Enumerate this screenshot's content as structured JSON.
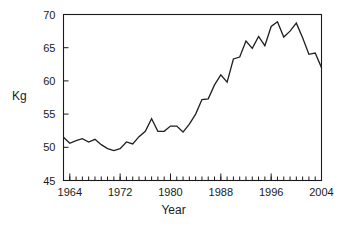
{
  "chart_data": {
    "type": "line",
    "title": "",
    "xlabel": "Year",
    "ylabel": "Kg",
    "xlim": [
      1963,
      2004
    ],
    "ylim": [
      45,
      70
    ],
    "grid": false,
    "legend": null,
    "x_ticks_major": [
      1964,
      1972,
      1980,
      1988,
      1996,
      2004
    ],
    "x_tick_labels": [
      "1964",
      "1972",
      "1980",
      "1988",
      "1996",
      "2004"
    ],
    "x_minor_tick_step": 1,
    "y_ticks": [
      45,
      50,
      55,
      60,
      65,
      70
    ],
    "y_tick_labels": [
      "45",
      "50",
      "55",
      "60",
      "65",
      "70"
    ],
    "line_color": "#1f1f1f",
    "series": [
      {
        "name": "Kg",
        "x": [
          1963,
          1964,
          1965,
          1966,
          1967,
          1968,
          1969,
          1970,
          1971,
          1972,
          1973,
          1974,
          1975,
          1976,
          1977,
          1978,
          1979,
          1980,
          1981,
          1982,
          1983,
          1984,
          1985,
          1986,
          1987,
          1988,
          1989,
          1990,
          1991,
          1992,
          1993,
          1994,
          1995,
          1996,
          1997,
          1998,
          1999,
          2000,
          2001,
          2002,
          2003,
          2004
        ],
        "values": [
          51.5,
          50.6,
          51.0,
          51.3,
          50.8,
          51.2,
          50.4,
          49.8,
          49.5,
          49.8,
          50.8,
          50.5,
          51.6,
          52.4,
          54.3,
          52.4,
          52.4,
          53.2,
          53.2,
          52.3,
          53.5,
          55.0,
          57.2,
          57.3,
          59.4,
          60.9,
          59.8,
          63.3,
          63.6,
          66.0,
          64.9,
          66.7,
          65.3,
          68.2,
          68.9,
          66.6,
          67.5,
          68.7,
          66.5,
          64.0,
          64.2,
          62.0
        ]
      }
    ]
  },
  "axes": {
    "y_title": "Kg",
    "x_title": "Year"
  }
}
